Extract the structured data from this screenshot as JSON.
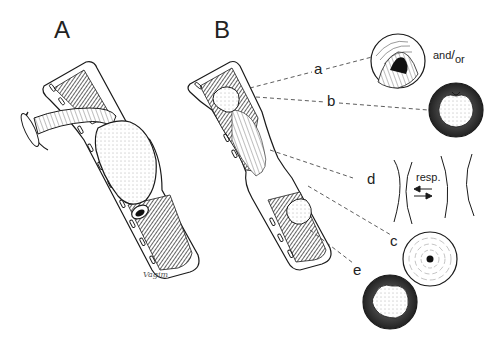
{
  "figure": {
    "panels": [
      {
        "id": "A",
        "label": "A",
        "description": "Trachea cutaway with endotracheal tube and inflated cuff"
      },
      {
        "id": "B",
        "label": "B",
        "description": "Trachea cutaway showing lesion sites after extubation"
      }
    ],
    "callouts": [
      {
        "id": "a",
        "label": "a",
        "description": "stomal granuloma / stenosis cross-section"
      },
      {
        "id": "b",
        "label": "b",
        "description": "granulation tissue cross-section"
      },
      {
        "id": "d",
        "label": "d",
        "description": "tracheomalacia segment"
      },
      {
        "id": "c",
        "label": "c",
        "description": "concentric stenosis cross-section"
      },
      {
        "id": "e",
        "label": "e",
        "description": "cuff-site granuloma cross-section"
      }
    ],
    "and_or": {
      "pre": "and",
      "post": "or"
    },
    "resp": {
      "label": "resp.",
      "arrows": "⇄"
    },
    "signature": "Vagim",
    "colors": {
      "ink": "#1a1a1a",
      "background": "#ffffff",
      "shade": "#555555"
    }
  }
}
